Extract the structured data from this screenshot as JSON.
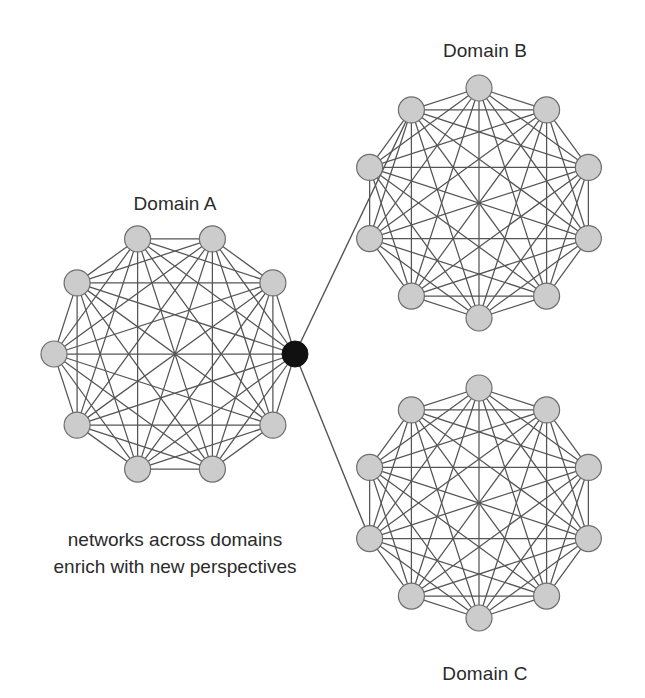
{
  "figure": {
    "width": 645,
    "height": 698,
    "background": "#ffffff",
    "node_fill": "#cccccc",
    "node_stroke": "#6e6e6e",
    "hub_fill": "#111111",
    "hub_stroke": "#111111",
    "edge_color": "#555555",
    "text_color": "#2b2b2b"
  },
  "labels": {
    "domain_a": "Domain A",
    "domain_b": "Domain B",
    "domain_c": "Domain C"
  },
  "caption": {
    "line1": "networks across domains",
    "line2": "enrich with new perspectives"
  },
  "chart_data": {
    "type": "diagram",
    "title": "networks across domains enrich with new perspectives",
    "graph_kind": "three complete graphs (K10) joined through one shared bridge node",
    "clusters": [
      {
        "id": "A",
        "label": "Domain A",
        "label_x": 175,
        "label_y": 193,
        "center_x": 175,
        "center_y": 354,
        "radius": 121,
        "node_count": 10,
        "node_radius": 13,
        "start_angle_deg": 0,
        "complete_graph": true,
        "hub_index": 0
      },
      {
        "id": "B",
        "label": "Domain B",
        "label_x": 485,
        "label_y": 40,
        "center_x": 479,
        "center_y": 203,
        "radius": 115,
        "node_count": 10,
        "node_radius": 13,
        "start_angle_deg": 18,
        "complete_graph": true,
        "hub_index": -1,
        "bridge_node_index": 6
      },
      {
        "id": "C",
        "label": "Domain C",
        "label_x": 485,
        "label_y": 663,
        "center_x": 479,
        "center_y": 503,
        "radius": 115,
        "node_count": 10,
        "node_radius": 13,
        "start_angle_deg": 18,
        "complete_graph": true,
        "hub_index": -1,
        "bridge_node_index": 4
      }
    ],
    "hub": {
      "x": 295,
      "y": 354,
      "radius": 13,
      "color": "#111111",
      "belongs_to": "A"
    },
    "bridges": [
      {
        "from": "hub",
        "to": "B",
        "to_node_index": 6
      },
      {
        "from": "hub",
        "to": "C",
        "to_node_index": 4
      }
    ],
    "legend": [],
    "annotations": [
      "networks across domains",
      "enrich with new perspectives"
    ]
  }
}
